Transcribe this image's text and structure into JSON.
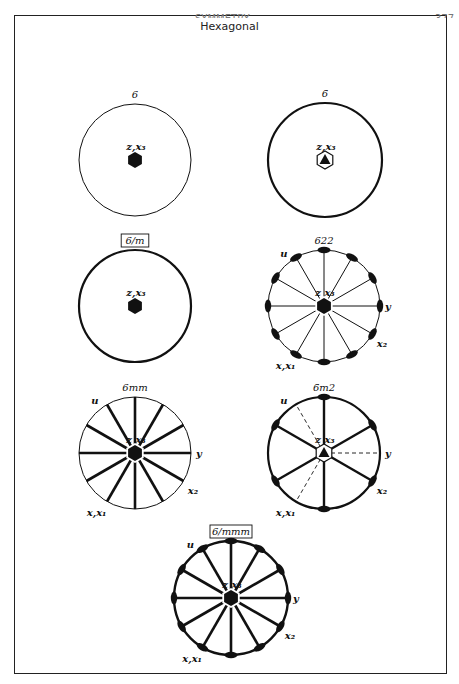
{
  "page": {
    "title": "Hexagonal",
    "header_fragment": "SYMMETRY",
    "page_number_fragment": "377"
  },
  "colors": {
    "ink": "#111111",
    "frame": "#222222",
    "background": "#ffffff"
  },
  "stereograms": [
    {
      "id": "6",
      "symbol": "6",
      "boxed": false,
      "cx": 135,
      "cy": 160,
      "r": 56,
      "circle_width": 1.0,
      "center_label": "z,x₃",
      "center_symbol": "filled-hexagon",
      "lines": [],
      "line_width": 0,
      "lenses": [],
      "dashed": [],
      "axis_labels": []
    },
    {
      "id": "-6",
      "symbol": "6̄",
      "boxed": false,
      "cx": 325,
      "cy": 160,
      "r": 57,
      "circle_width": 2.2,
      "center_label": "z,x₃",
      "center_symbol": "hexagon-with-triangle",
      "lines": [],
      "line_width": 0,
      "lenses": [],
      "dashed": [],
      "axis_labels": []
    },
    {
      "id": "6/m",
      "symbol": "6/m",
      "boxed": true,
      "cx": 135,
      "cy": 306,
      "r": 56,
      "circle_width": 2.2,
      "center_label": "z,x₃",
      "center_symbol": "filled-hexagon",
      "lines": [],
      "line_width": 0,
      "lenses": [],
      "dashed": [],
      "axis_labels": []
    },
    {
      "id": "622",
      "symbol": "622",
      "boxed": false,
      "cx": 324,
      "cy": 306,
      "r": 56,
      "circle_width": 1.0,
      "center_label": "z x₃",
      "center_symbol": "filled-hexagon",
      "lines": [
        0,
        30,
        60,
        90,
        120,
        150,
        180,
        210,
        240,
        270,
        300,
        330
      ],
      "line_width": 1.0,
      "lenses": [
        0,
        30,
        60,
        90,
        120,
        150,
        180,
        210,
        240,
        270,
        300,
        330
      ],
      "dashed": [],
      "axis_labels": [
        {
          "text": "u",
          "angle": 120
        },
        {
          "text": "y",
          "angle": 0
        },
        {
          "text": "x₂",
          "angle": 330
        },
        {
          "text": "x,x₁",
          "angle": 240
        }
      ]
    },
    {
      "id": "6mm",
      "symbol": "6mm",
      "boxed": false,
      "cx": 135,
      "cy": 453,
      "r": 56,
      "circle_width": 1.0,
      "center_label": "z x₃",
      "center_symbol": "filled-hexagon",
      "lines": [
        0,
        30,
        60,
        90,
        120,
        150,
        180,
        210,
        240,
        270,
        300,
        330
      ],
      "line_width": 2.6,
      "lenses": [],
      "dashed": [],
      "axis_labels": [
        {
          "text": "u",
          "angle": 120
        },
        {
          "text": "y",
          "angle": 0
        },
        {
          "text": "x₂",
          "angle": 330
        },
        {
          "text": "x,x₁",
          "angle": 240
        }
      ]
    },
    {
      "id": "-6m2",
      "symbol": "6̄m2",
      "boxed": false,
      "cx": 324,
      "cy": 453,
      "r": 56,
      "circle_width": 2.2,
      "center_label": "z  x₃",
      "center_symbol": "hexagon-with-triangle",
      "lines": [
        30,
        90,
        150,
        210,
        270,
        330
      ],
      "line_width": 2.4,
      "lenses": [
        30,
        90,
        150,
        210,
        270,
        330
      ],
      "dashed": [
        0,
        120,
        240
      ],
      "axis_labels": [
        {
          "text": "u",
          "angle": 120
        },
        {
          "text": "y",
          "angle": 0
        },
        {
          "text": "x₂",
          "angle": 330
        },
        {
          "text": "x,x₁",
          "angle": 240
        }
      ]
    },
    {
      "id": "6/mmm",
      "symbol": "6/mmm",
      "boxed": true,
      "cx": 231,
      "cy": 598,
      "r": 57,
      "circle_width": 2.4,
      "center_label": "z x₃",
      "center_symbol": "filled-hexagon",
      "lines": [
        0,
        30,
        60,
        90,
        120,
        150,
        180,
        210,
        240,
        270,
        300,
        330
      ],
      "line_width": 2.6,
      "lenses": [
        0,
        30,
        60,
        90,
        120,
        150,
        180,
        210,
        240,
        270,
        300,
        330
      ],
      "dashed": [],
      "axis_labels": [
        {
          "text": "u",
          "angle": 120
        },
        {
          "text": "y",
          "angle": 0
        },
        {
          "text": "x₂",
          "angle": 330
        },
        {
          "text": "x,x₁",
          "angle": 240
        }
      ]
    }
  ]
}
